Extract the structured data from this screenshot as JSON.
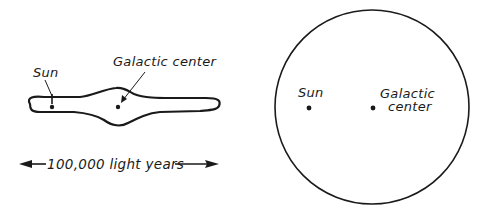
{
  "figure": {
    "edge_on_view": {
      "labels": {
        "sun": "Sun",
        "galactic_center": "Galactic center"
      },
      "scale_bar": {
        "label": "100,000 light years"
      }
    },
    "face_on_view": {
      "labels": {
        "sun": "Sun",
        "galactic_center_line1": "Galactic",
        "galactic_center_line2": "center"
      }
    },
    "colors": {
      "ink": "#1a1a1a",
      "background": "#ffffff"
    }
  }
}
